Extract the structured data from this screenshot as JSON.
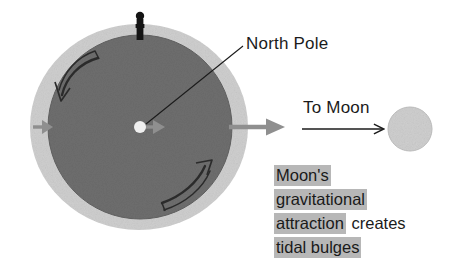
{
  "figure": {
    "title": "Moon's gravitational attraction creates tidal bulges",
    "background_color": "#ffffff"
  },
  "labels": {
    "north_pole": "North Pole",
    "to_moon": "To Moon"
  },
  "caption": {
    "line1_highlight": "Moon's",
    "line2_highlight": "gravitational",
    "line3_highlight": "attraction",
    "line3_plain": "creates",
    "line4_highlight": "tidal bulges",
    "highlight_color": "#b7b7b7",
    "text_color": "#1a1a1a"
  },
  "colors": {
    "earth": "#6e6e6e",
    "earth_edge": "#5f5f5f",
    "tidal_bulge": "#cfcfcf",
    "moon": "#cfcfcf",
    "moon_edge": "#bdbdbd",
    "pole_marker": "#141414",
    "pole_dot": "#efefef",
    "gray_arrow": "#8c8c8c",
    "thin_arrow": "#1b1b1b",
    "rotation_arrow": "#2a2a2a",
    "leader_line": "#1b1b1b"
  },
  "geometry": {
    "bulge_center_x": 139,
    "bulge_center_y": 127,
    "bulge_radius_x": 109,
    "bulge_radius_y": 103,
    "earth_center_x": 140,
    "earth_center_y": 127,
    "earth_radius": 92,
    "moon_center_x": 410,
    "moon_center_y": 129,
    "moon_radius": 22,
    "pole_dot_x": 140,
    "pole_dot_y": 127,
    "pole_dot_radius": 6
  },
  "icons": {
    "pole_marker": "pole-marker-icon",
    "rotation_ccw_upper": "rotation-arrow-counterclockwise-icon",
    "rotation_ccw_lower": "rotation-arrow-counterclockwise-icon",
    "bulge_arrow_left": "tidal-force-arrow-icon",
    "bulge_arrow_center": "tidal-force-arrow-icon",
    "earth_to_moon_arrow": "direction-arrow-icon",
    "to_moon_arrow": "to-moon-arrow-icon"
  }
}
